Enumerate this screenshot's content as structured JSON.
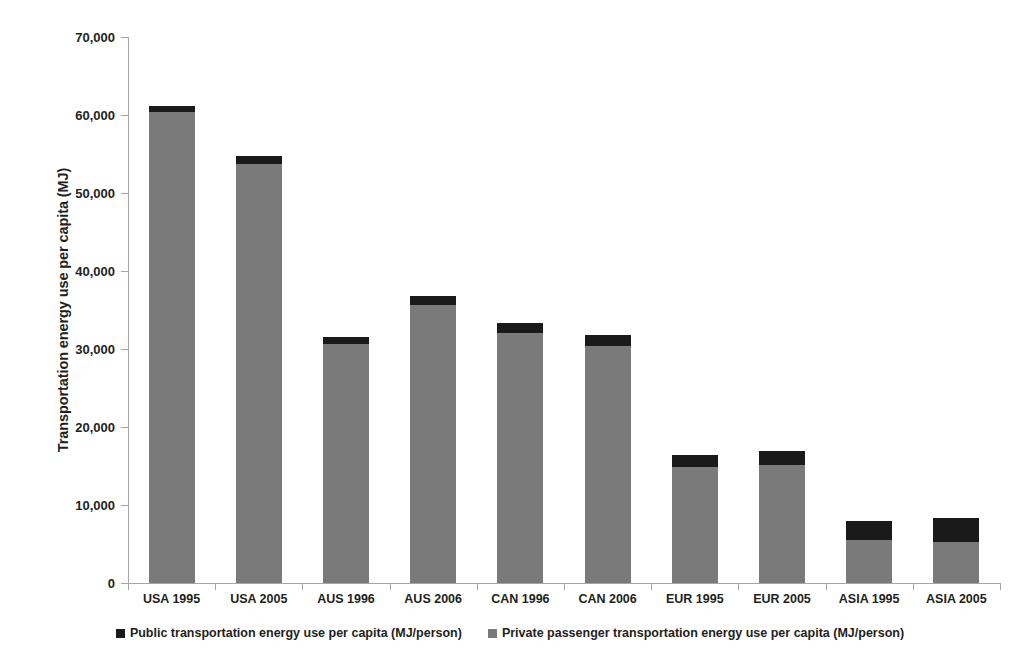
{
  "chart_data": {
    "type": "bar",
    "stacked": true,
    "title": "",
    "xlabel": "",
    "ylabel": "Transportation energy use per capita (MJ)",
    "ylim": [
      0,
      70000
    ],
    "ytick_labels": [
      "70,000",
      "60,000",
      "50,000",
      "40,000",
      "30,000",
      "20,000",
      "10,000",
      "0"
    ],
    "ytick_values": [
      70000,
      60000,
      50000,
      40000,
      30000,
      20000,
      10000,
      0
    ],
    "grid": false,
    "legend_position": "bottom",
    "categories": [
      "USA 1995",
      "USA 2005",
      "AUS 1996",
      "AUS 2006",
      "CAN 1996",
      "CAN 2006",
      "EUR 1995",
      "EUR 2005",
      "ASIA 1995",
      "ASIA 2005"
    ],
    "series": [
      {
        "name": "Private passenger transportation energy use per capita (MJ/person)",
        "color": "#7a7a7a",
        "values": [
          60350,
          53680,
          30640,
          35640,
          32010,
          30380,
          14910,
          15130,
          5510,
          5300
        ]
      },
      {
        "name": "Public transportation energy use per capita (MJ/person)",
        "color": "#1a1a1a",
        "values": [
          850,
          1070,
          940,
          1160,
          1290,
          1420,
          1540,
          1830,
          2480,
          2990
        ]
      }
    ],
    "totals": [
      61200,
      54750,
      31580,
      36800,
      33300,
      31800,
      16450,
      16960,
      7990,
      8290
    ]
  },
  "legend": {
    "items": [
      {
        "label": "Public transportation energy use per capita (MJ/person)",
        "color": "#1a1a1a"
      },
      {
        "label": "Private passenger transportation energy use per capita (MJ/person)",
        "color": "#7a7a7a"
      }
    ]
  }
}
